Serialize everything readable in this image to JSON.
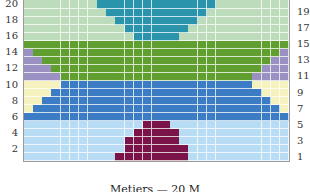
{
  "chart_data": {
    "type": "heatmap",
    "title": "",
    "caption": "Metiers — 20 M",
    "columns": 29,
    "rows": 20,
    "left_axis_labels": [
      "2",
      "4",
      "6",
      "8",
      "10",
      "12",
      "14",
      "16",
      "18",
      "20"
    ],
    "right_axis_labels": [
      "1",
      "3",
      "5",
      "7",
      "9",
      "11",
      "13",
      "15",
      "17",
      "19"
    ],
    "colors": {
      "lightblue": "#b9dcf5",
      "maroon": "#7a1448",
      "blue": "#3b7cc4",
      "yellow": "#f6f2c0",
      "green": "#5f9e2f",
      "purple": "#9a90c2",
      "palegreen": "#bcdcbc",
      "teal": "#2b94ad"
    },
    "bands": [
      {
        "rows": [
          1,
          5
        ],
        "base": "lightblue",
        "feature": "maroon",
        "shape": "center-triangle",
        "feature_cols": {
          "1": [
            10,
            17
          ],
          "2": [
            11,
            17
          ],
          "3": [
            11,
            16
          ],
          "4": [
            12,
            16
          ],
          "5": [
            13,
            15
          ]
        }
      },
      {
        "rows": [
          6,
          10
        ],
        "base": "blue",
        "feature": "yellow",
        "shape": "side-triangles",
        "side_width": {
          "6": 0,
          "7": 1,
          "8": 2,
          "9": 3,
          "10": 4
        }
      },
      {
        "rows": [
          11,
          15
        ],
        "base": "green",
        "feature": "purple",
        "shape": "side-triangles",
        "side_width": {
          "11": 4,
          "12": 3,
          "13": 2,
          "14": 1,
          "15": 0
        }
      },
      {
        "rows": [
          16,
          20
        ],
        "base": "palegreen",
        "feature": "teal",
        "shape": "center-inverted-triangle",
        "feature_cols": {
          "16": [
            12,
            16
          ],
          "17": [
            11,
            17
          ],
          "18": [
            10,
            18
          ],
          "19": [
            9,
            19
          ],
          "20": [
            8,
            20
          ]
        }
      }
    ]
  }
}
